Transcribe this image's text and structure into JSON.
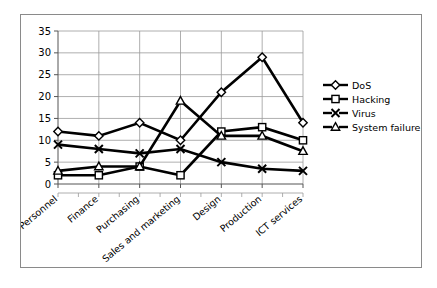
{
  "chart_data": {
    "type": "line",
    "title": "",
    "xlabel": "",
    "ylabel": "",
    "ylim": [
      0,
      35
    ],
    "yticks": [
      0,
      5,
      10,
      15,
      20,
      25,
      30,
      35
    ],
    "grid": true,
    "legend_position": "right",
    "categories": [
      "Personnel",
      "Finance",
      "Purchasing",
      "Sales and marketing",
      "Design",
      "Production",
      "ICT services"
    ],
    "series": [
      {
        "name": "DoS",
        "marker": "diamond",
        "values": [
          12,
          11,
          14,
          10,
          21,
          29,
          14
        ]
      },
      {
        "name": "Hacking",
        "marker": "square",
        "values": [
          2,
          2,
          4,
          2,
          12,
          13,
          10
        ]
      },
      {
        "name": "Virus",
        "marker": "x",
        "values": [
          9,
          8,
          7,
          8,
          5,
          3.5,
          3
        ]
      },
      {
        "name": "System failure",
        "marker": "triangle",
        "values": [
          3,
          4,
          4,
          19,
          11,
          11,
          7.5
        ]
      }
    ]
  },
  "axis": {
    "tick_labels": [
      "0",
      "5",
      "10",
      "15",
      "20",
      "25",
      "30",
      "35"
    ]
  },
  "legend": {
    "entries": [
      {
        "label": "DoS"
      },
      {
        "label": "Hacking"
      },
      {
        "label": "Virus"
      },
      {
        "label": "System failure"
      }
    ]
  },
  "colors": {
    "series_stroke": "#000000",
    "marker_fill": "#ffffff",
    "gridline": "#9a9a9a",
    "border": "#8a8a8a",
    "background": "#ffffff"
  }
}
